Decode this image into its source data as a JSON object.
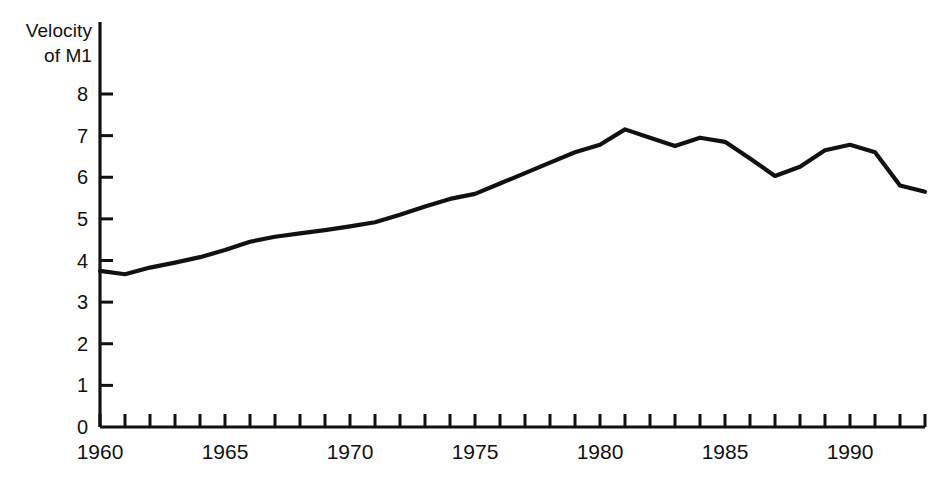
{
  "chart_data": {
    "type": "line",
    "title": "",
    "ylabel": "Velocity\nof M1",
    "xlabel": "",
    "ylim": [
      0,
      8.35
    ],
    "xlim": [
      1960,
      1993
    ],
    "grid": false,
    "legend": null,
    "y_ticks": [
      "0",
      "1",
      "2",
      "3",
      "4",
      "5",
      "6",
      "7",
      "8"
    ],
    "y_tick_values": [
      0,
      1,
      2,
      3,
      4,
      5,
      6,
      7,
      8
    ],
    "x_ticks": [
      "1960",
      "1965",
      "1970",
      "1975",
      "1980",
      "1985",
      "1990"
    ],
    "x_tick_values": [
      1960,
      1965,
      1970,
      1975,
      1980,
      1985,
      1990
    ],
    "x_minor_tick_values": [
      1960,
      1961,
      1962,
      1963,
      1964,
      1965,
      1966,
      1967,
      1968,
      1969,
      1970,
      1971,
      1972,
      1973,
      1974,
      1975,
      1976,
      1977,
      1978,
      1979,
      1980,
      1981,
      1982,
      1983,
      1984,
      1985,
      1986,
      1987,
      1988,
      1989,
      1990,
      1991,
      1992,
      1993
    ],
    "series": [
      {
        "name": "Velocity of M1",
        "color": "#111111",
        "x": [
          1960,
          1961,
          1962,
          1963,
          1964,
          1965,
          1966,
          1967,
          1968,
          1969,
          1970,
          1971,
          1972,
          1973,
          1974,
          1975,
          1976,
          1977,
          1978,
          1979,
          1980,
          1981,
          1982,
          1983,
          1984,
          1985,
          1986,
          1987,
          1988,
          1989,
          1990,
          1991,
          1992,
          1993
        ],
        "values": [
          3.75,
          3.67,
          3.83,
          3.95,
          4.08,
          4.25,
          4.45,
          4.57,
          4.65,
          4.73,
          4.82,
          4.92,
          5.1,
          5.3,
          5.48,
          5.6,
          5.85,
          6.1,
          6.35,
          6.6,
          6.78,
          7.15,
          6.95,
          6.75,
          6.95,
          6.85,
          6.45,
          6.03,
          6.25,
          6.65,
          6.78,
          6.6,
          5.8,
          5.65
        ]
      }
    ]
  },
  "axis": {
    "y_title_line1": "Velocity",
    "y_title_line2": "of M1"
  },
  "colors": {
    "line": "#111111",
    "axis": "#111111",
    "background": "#ffffff"
  }
}
